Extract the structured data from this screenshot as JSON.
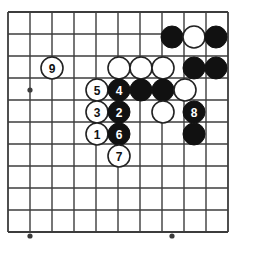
{
  "figure": {
    "kind": "go-board-diagram",
    "background_color": "#ffffff",
    "line_color": "#3c3c3c",
    "black_stone_color": "#111111",
    "white_stone_color": "#ffffff",
    "white_stone_border_color": "#222222",
    "black_label_color": "#ffffff",
    "white_label_color": "#111111"
  },
  "board": {
    "origin_x": 8,
    "origin_y": 12,
    "spacing": 22,
    "cols": 11,
    "rows": 11,
    "stone_radius": 11,
    "border_right_x": 238,
    "border_bottom_y": 236,
    "star_points": [
      {
        "x": 30,
        "y": 90
      },
      {
        "x": 30,
        "y": 236
      },
      {
        "x": 172,
        "y": 236
      }
    ]
  },
  "stones": [
    {
      "id": "b-top-1",
      "color": "black",
      "x": 172,
      "y": 37,
      "label": ""
    },
    {
      "id": "w-top-1",
      "color": "white",
      "x": 194,
      "y": 37,
      "label": ""
    },
    {
      "id": "b-top-2",
      "color": "black",
      "x": 216,
      "y": 37,
      "label": ""
    },
    {
      "id": "move-9",
      "color": "white",
      "x": 52,
      "y": 68,
      "label": "9"
    },
    {
      "id": "w-r2-1",
      "color": "white",
      "x": 119,
      "y": 68,
      "label": ""
    },
    {
      "id": "w-r2-2",
      "color": "white",
      "x": 141,
      "y": 68,
      "label": ""
    },
    {
      "id": "w-r2-3",
      "color": "white",
      "x": 163,
      "y": 68,
      "label": ""
    },
    {
      "id": "b-r2-1",
      "color": "black",
      "x": 194,
      "y": 68,
      "label": ""
    },
    {
      "id": "b-r2-2",
      "color": "black",
      "x": 216,
      "y": 68,
      "label": ""
    },
    {
      "id": "move-5",
      "color": "white",
      "x": 97,
      "y": 90,
      "label": "5"
    },
    {
      "id": "move-4",
      "color": "black",
      "x": 119,
      "y": 90,
      "label": "4"
    },
    {
      "id": "b-r3-1",
      "color": "black",
      "x": 141,
      "y": 90,
      "label": ""
    },
    {
      "id": "b-r3-2",
      "color": "black",
      "x": 163,
      "y": 90,
      "label": ""
    },
    {
      "id": "w-r3-1",
      "color": "white",
      "x": 185,
      "y": 90,
      "label": ""
    },
    {
      "id": "move-3",
      "color": "white",
      "x": 97,
      "y": 112,
      "label": "3"
    },
    {
      "id": "move-2",
      "color": "black",
      "x": 119,
      "y": 112,
      "label": "2"
    },
    {
      "id": "w-r4-1",
      "color": "white",
      "x": 163,
      "y": 112,
      "label": ""
    },
    {
      "id": "move-8",
      "color": "black",
      "x": 194,
      "y": 112,
      "label": "8"
    },
    {
      "id": "move-1",
      "color": "white",
      "x": 97,
      "y": 134,
      "label": "1"
    },
    {
      "id": "move-6",
      "color": "black",
      "x": 119,
      "y": 134,
      "label": "6"
    },
    {
      "id": "b-r5-1",
      "color": "black",
      "x": 194,
      "y": 134,
      "label": ""
    },
    {
      "id": "move-7",
      "color": "white",
      "x": 119,
      "y": 156,
      "label": "7"
    }
  ],
  "move_sequence": [
    "1",
    "2",
    "3",
    "4",
    "5",
    "6",
    "7",
    "8",
    "9"
  ]
}
